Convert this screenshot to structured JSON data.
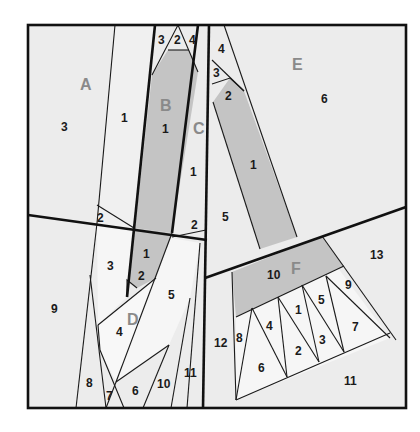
{
  "colors": {
    "background": "#ececec",
    "shaded": "#c4c4c4",
    "light": "#f6f6f6",
    "line": "#1a1a1a",
    "section_label": "#8a8a8a"
  },
  "sections": [
    {
      "id": "A",
      "label": "A",
      "pieces": [
        "1",
        "2",
        "3"
      ]
    },
    {
      "id": "B",
      "label": "B",
      "pieces": [
        "1",
        "2",
        "3",
        "4"
      ]
    },
    {
      "id": "C",
      "label": "C",
      "pieces": [
        "1",
        "2"
      ]
    },
    {
      "id": "D",
      "label": "D",
      "pieces": [
        "1",
        "2",
        "3",
        "4",
        "5",
        "6",
        "7",
        "8",
        "9",
        "10",
        "11"
      ]
    },
    {
      "id": "E",
      "label": "E",
      "pieces": [
        "1",
        "2",
        "3",
        "4",
        "5",
        "6"
      ]
    },
    {
      "id": "F",
      "label": "F",
      "pieces": [
        "1",
        "2",
        "3",
        "4",
        "5",
        "6",
        "7",
        "8",
        "9",
        "10",
        "11",
        "12",
        "13"
      ]
    }
  ],
  "labels": {
    "A": "A",
    "B": "B",
    "C": "C",
    "D": "D",
    "E": "E",
    "F": "F",
    "A1": "1",
    "A2": "2",
    "A3": "3",
    "B1": "1",
    "B2": "2",
    "B3": "3",
    "B4": "4",
    "C1": "1",
    "C2": "2",
    "D1": "1",
    "D2": "2",
    "D3": "3",
    "D4": "4",
    "D5": "5",
    "D6": "6",
    "D7": "7",
    "D8": "8",
    "D9": "9",
    "D10": "10",
    "D11": "11",
    "E1": "1",
    "E2": "2",
    "E3": "3",
    "E4": "4",
    "E5": "5",
    "E6": "6",
    "F1": "1",
    "F2": "2",
    "F3": "3",
    "F4": "4",
    "F5": "5",
    "F6": "6",
    "F7": "7",
    "F8": "8",
    "F9": "9",
    "F10": "10",
    "F11": "11",
    "F12": "12",
    "F13": "13"
  }
}
